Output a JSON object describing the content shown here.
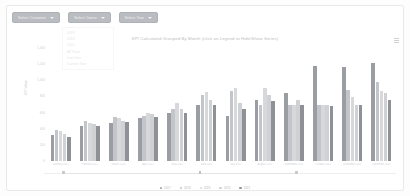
{
  "toolbar": {
    "filters": [
      {
        "label": "Select Customer",
        "icon": "chevron-down-icon"
      },
      {
        "label": "Select Owner",
        "icon": "chevron-down-icon"
      },
      {
        "label": "Select Year",
        "icon": "chevron-down-icon"
      }
    ]
  },
  "dropdown_panel": {
    "open": true,
    "options": [
      "2019",
      "2020",
      "2021",
      "All Years",
      "Last Year",
      "Current Year"
    ]
  },
  "chart_menu": {
    "icon": "hamburger-menu-icon"
  },
  "chart_data": {
    "type": "bar",
    "title": "KPI Calculated Grouped By Month (click on Legend to Hide/Show Series)",
    "xlabel": "",
    "ylabel": "KPI Value",
    "ylim": [
      0,
      1400
    ],
    "yticks": [
      "1,400",
      "1,200",
      "1,000",
      "800",
      "600",
      "400",
      "200",
      "0"
    ],
    "grid": false,
    "legend_position": "bottom",
    "categories": [
      "January 2021",
      "February 2021",
      "March 2021",
      "April 2021",
      "May 2021",
      "June 2021",
      "July 2021",
      "August 2021",
      "September 2021",
      "October 2021",
      "November 2021",
      "December 2021"
    ],
    "series": [
      {
        "name": "2017",
        "color": "#9a9da1",
        "values": [
          320,
          430,
          470,
          530,
          600,
          700,
          560,
          760,
          840,
          1180,
          1170,
          1220
        ]
      },
      {
        "name": "2018",
        "color": "#c2c5c9",
        "values": [
          380,
          500,
          540,
          560,
          640,
          820,
          870,
          700,
          690,
          700,
          880,
          980
        ]
      },
      {
        "name": "2019",
        "color": "#d6d8da",
        "values": [
          370,
          470,
          530,
          600,
          720,
          860,
          900,
          900,
          700,
          690,
          790,
          870
        ]
      },
      {
        "name": "2020",
        "color": "#cfd1d4",
        "values": [
          330,
          460,
          500,
          580,
          640,
          760,
          720,
          820,
          760,
          690,
          700,
          840
        ]
      },
      {
        "name": "2021",
        "color": "#8e9195",
        "values": [
          300,
          440,
          480,
          540,
          600,
          690,
          650,
          740,
          700,
          680,
          690,
          760
        ]
      }
    ]
  },
  "range_slider": {
    "start_label": "",
    "end_label": "",
    "handles": [
      "left-handle",
      "mid-handle",
      "right-handle"
    ]
  }
}
